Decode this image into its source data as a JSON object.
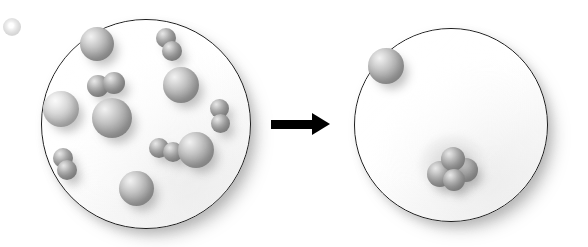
{
  "figure": {
    "title": "Particle diagram of a gas-phase change",
    "caption": "Left container of dispersed atoms and diatomic molecules converts to a right container holding one lone atom and one condensed cluster.",
    "background_color": "#ffffff",
    "outline_color": "#1c1c1c",
    "particle_color": "#9b9b9b",
    "arrow_color": "#000000"
  },
  "arrow": {
    "name": "reaction-arrow",
    "direction": "right",
    "label": ""
  },
  "stray_particle": {
    "name": "stray-particle",
    "label": "",
    "x": 3,
    "y": 18,
    "size": 18
  },
  "panels": [
    {
      "id": "left-vessel",
      "label": "",
      "center_x": 145,
      "center_y": 123,
      "diameter": 208,
      "particle_count": 16,
      "single_atom_count": 6,
      "molecule_count": 5,
      "particles": [
        {
          "kind": "atom",
          "x": 97,
          "y": 44,
          "d": 34,
          "shade": "normal"
        },
        {
          "kind": "molecule",
          "x": 98,
          "y": 86,
          "d": 22,
          "shade": "dark",
          "offset_x": 16,
          "offset_y": -3
        },
        {
          "kind": "atom",
          "x": 61,
          "y": 109,
          "d": 36,
          "shade": "pale"
        },
        {
          "kind": "atom",
          "x": 112,
          "y": 118,
          "d": 40,
          "shade": "normal"
        },
        {
          "kind": "molecule",
          "x": 166,
          "y": 38,
          "d": 20,
          "shade": "dark",
          "offset_x": 6,
          "offset_y": 13
        },
        {
          "kind": "atom",
          "x": 181,
          "y": 85,
          "d": 36,
          "shade": "normal"
        },
        {
          "kind": "molecule",
          "x": 219,
          "y": 108,
          "d": 19,
          "shade": "dark",
          "offset_x": 1,
          "offset_y": 15
        },
        {
          "kind": "molecule",
          "x": 159,
          "y": 148,
          "d": 20,
          "shade": "dark",
          "offset_x": 14,
          "offset_y": 4
        },
        {
          "kind": "atom",
          "x": 196,
          "y": 150,
          "d": 36,
          "shade": "normal"
        },
        {
          "kind": "molecule",
          "x": 63,
          "y": 158,
          "d": 20,
          "shade": "dark",
          "offset_x": 4,
          "offset_y": 12
        },
        {
          "kind": "atom",
          "x": 136,
          "y": 188,
          "d": 35,
          "shade": "normal"
        }
      ]
    },
    {
      "id": "right-vessel",
      "label": "",
      "center_x": 450,
      "center_y": 124,
      "diameter": 192,
      "particle_count": 5,
      "single_atom_count": 1,
      "cluster_count": 1,
      "particles": [
        {
          "kind": "atom",
          "x": 386,
          "y": 66,
          "d": 36,
          "shade": "normal"
        },
        {
          "kind": "cluster",
          "x": 452,
          "y": 168,
          "d": 26,
          "shade": "dark",
          "members": [
            {
              "dx": -12,
              "dy": 6,
              "d": 26
            },
            {
              "dx": 14,
              "dy": 2,
              "d": 24
            },
            {
              "dx": 1,
              "dy": -9,
              "d": 24
            },
            {
              "dx": 2,
              "dy": 12,
              "d": 22
            }
          ]
        }
      ]
    }
  ]
}
